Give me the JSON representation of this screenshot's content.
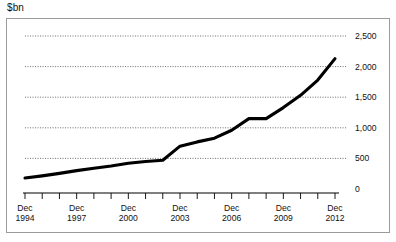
{
  "unit_label": "$bn",
  "chart_data": {
    "type": "line",
    "title": "",
    "subtitle": "",
    "xlabel": "",
    "ylabel": "$bn",
    "ylim": [
      0,
      2500
    ],
    "yticks": [
      0,
      500,
      1000,
      1500,
      2000,
      2500
    ],
    "ytick_labels": [
      "0",
      "500",
      "1,000",
      "1,500",
      "2,000",
      "2,500"
    ],
    "y_axis_position": "right",
    "grid": "horizontal-dotted",
    "legend": "none",
    "x_tick_labels": [
      {
        "line1": "Dec",
        "line2": "1994"
      },
      {
        "line1": "Dec",
        "line2": "1997"
      },
      {
        "line1": "Dec",
        "line2": "2000"
      },
      {
        "line1": "Dec",
        "line2": "2003"
      },
      {
        "line1": "Dec",
        "line2": "2006"
      },
      {
        "line1": "Dec",
        "line2": "2009"
      },
      {
        "line1": "Dec",
        "line2": "2012"
      }
    ],
    "x_minor_ticks": [
      "1994",
      "1995",
      "1996",
      "1997",
      "1998",
      "1999",
      "2000",
      "2001",
      "2002",
      "2003",
      "2004",
      "2005",
      "2006",
      "2007",
      "2008",
      "2009",
      "2010",
      "2011",
      "2012"
    ],
    "x": [
      "Dec 1994",
      "Dec 1995",
      "Dec 1996",
      "Dec 1997",
      "Dec 1998",
      "Dec 1999",
      "Dec 2000",
      "Dec 2001",
      "Dec 2002",
      "Dec 2003",
      "Dec 2004",
      "Dec 2005",
      "Dec 2006",
      "Dec 2007",
      "Dec 2008",
      "Dec 2009",
      "Dec 2010",
      "Dec 2011",
      "Dec 2012"
    ],
    "values": [
      180,
      215,
      255,
      300,
      340,
      375,
      420,
      450,
      470,
      700,
      770,
      830,
      960,
      1150,
      1150,
      1330,
      1530,
      1780,
      2130
    ],
    "series": [
      {
        "name": "",
        "color": "#000000",
        "values": [
          180,
          215,
          255,
          300,
          340,
          375,
          420,
          450,
          470,
          700,
          770,
          830,
          960,
          1150,
          1150,
          1330,
          1530,
          1780,
          2130
        ]
      }
    ]
  },
  "colors": {
    "line": "#000000",
    "grid": "#555555",
    "axis": "#000000",
    "panel_border": "#9b9b9b",
    "background": "#ffffff",
    "text": "#111111"
  }
}
